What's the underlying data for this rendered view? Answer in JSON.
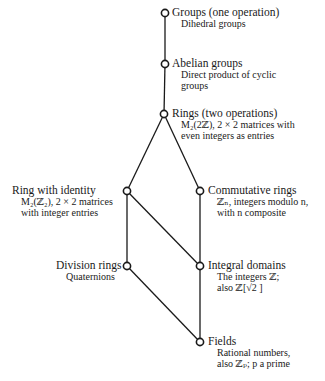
{
  "diagram": {
    "type": "hasse-diagram",
    "nodes": [
      {
        "id": "groups",
        "x": 165,
        "y": 13,
        "title": "Groups (one operation)",
        "example": [
          "Dihedral groups"
        ]
      },
      {
        "id": "abelian",
        "x": 165,
        "y": 64,
        "title": "Abelian groups",
        "example": [
          "Direct product of cyclic",
          "groups"
        ]
      },
      {
        "id": "rings",
        "x": 164,
        "y": 114,
        "title": "Rings (two operations)",
        "example": [
          "M₂(2ℤ), 2 × 2 matrices with",
          "even integers as entries"
        ]
      },
      {
        "id": "ring-identity",
        "x": 127,
        "y": 191,
        "title": "Ring with identity",
        "example": [
          "M₂(ℤ₂), 2 × 2 matrices",
          "with integer entries"
        ]
      },
      {
        "id": "commutative",
        "x": 200,
        "y": 191,
        "title": "Commutative rings",
        "example": [
          "ℤₙ, integers modulo n,",
          "with n composite"
        ]
      },
      {
        "id": "division",
        "x": 127,
        "y": 266,
        "title": "Division rings",
        "example": [
          "Quaternions"
        ]
      },
      {
        "id": "integral",
        "x": 200,
        "y": 266,
        "title": "Integral domains",
        "example": [
          "The integers ℤ;",
          "also ℤ[√2 ]"
        ]
      },
      {
        "id": "fields",
        "x": 200,
        "y": 342,
        "title": "Fields",
        "example": [
          "Rational numbers,",
          "also ℤₚ; p a prime"
        ]
      }
    ],
    "edges": [
      [
        "groups",
        "abelian"
      ],
      [
        "abelian",
        "rings"
      ],
      [
        "rings",
        "ring-identity"
      ],
      [
        "rings",
        "commutative"
      ],
      [
        "ring-identity",
        "division"
      ],
      [
        "ring-identity",
        "integral"
      ],
      [
        "commutative",
        "integral"
      ],
      [
        "division",
        "fields"
      ],
      [
        "integral",
        "fields"
      ]
    ],
    "colors": {
      "line": "#1a1a1a",
      "node_fill": "#ffffff",
      "background": "#ffffff"
    }
  }
}
